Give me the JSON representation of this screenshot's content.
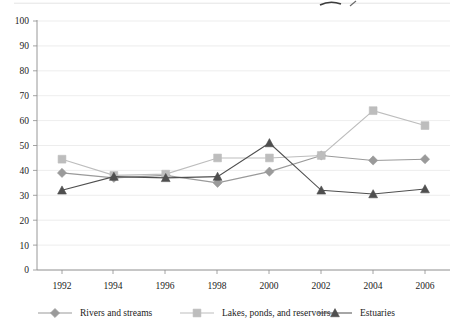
{
  "chart_data": {
    "type": "line",
    "title": "",
    "subtitle": "",
    "xlabel": "",
    "ylabel": "",
    "x": [
      1992,
      1994,
      1996,
      1998,
      2000,
      2002,
      2004,
      2006
    ],
    "categories": [
      "1992",
      "1994",
      "1996",
      "1998",
      "2000",
      "2002",
      "2004",
      "2006"
    ],
    "xlim": [
      1991,
      2007
    ],
    "ylim": [
      0,
      100
    ],
    "yticks": [
      0,
      10,
      20,
      30,
      40,
      50,
      60,
      70,
      80,
      90,
      100
    ],
    "ytick_labels": [
      "0",
      "10",
      "20",
      "30",
      "40",
      "50",
      "60",
      "70",
      "80",
      "90",
      "100"
    ],
    "xtick_labels": [
      "1992",
      "1994",
      "1996",
      "1998",
      "2000",
      "2002",
      "2004",
      "2006"
    ],
    "grid": true,
    "grid_axis": "y",
    "legend_position": "bottom",
    "series": [
      {
        "name": "Rivers and streams",
        "marker": "diamond",
        "color": "#9a9a9a",
        "values": [
          39,
          37,
          38,
          35,
          39.5,
          46,
          44,
          44.5
        ]
      },
      {
        "name": "Lakes, ponds, and reservoirs",
        "marker": "square",
        "color": "#bdbdbd",
        "values": [
          44.5,
          38,
          38.5,
          45,
          45,
          46,
          64,
          58
        ]
      },
      {
        "name": "Estuaries",
        "marker": "triangle",
        "color": "#4f4f4f",
        "values": [
          32,
          37.5,
          37,
          37.5,
          51,
          32,
          30.5,
          32.5
        ]
      }
    ]
  },
  "legend": {
    "items": [
      {
        "label": "Rivers and streams",
        "marker": "diamond",
        "color": "#9a9a9a"
      },
      {
        "label": "Lakes, ponds, and reservoirs",
        "marker": "square",
        "color": "#bdbdbd"
      },
      {
        "label": "Estuaries",
        "marker": "triangle",
        "color": "#4f4f4f"
      }
    ]
  },
  "colors": {
    "rivers": "#9a9a9a",
    "lakes": "#bdbdbd",
    "estuaries": "#4f4f4f",
    "grid": "#e9e9e9",
    "axis": "#8d8d8d",
    "text": "#1b1b1b",
    "background": "#ffffff"
  }
}
